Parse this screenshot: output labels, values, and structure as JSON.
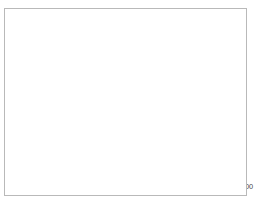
{
  "chart_data": {
    "type": "line",
    "title": "",
    "xlabel": "",
    "ylabel": "",
    "xlim": [
      1978,
      2000
    ],
    "ylim": [
      0,
      2500
    ],
    "grid": true,
    "legend_position": "top-left",
    "x": [
      1978,
      1979,
      1980,
      1981,
      1982,
      1983,
      1984,
      1985,
      1986,
      1987,
      1988,
      1989,
      1990,
      1991,
      1992,
      1993,
      1994,
      1995,
      1996,
      1997,
      1998,
      1999,
      2000
    ],
    "xtick_labels": [
      "1978",
      "1980",
      "1982",
      "1984",
      "1986",
      "1988",
      "1990",
      "1992",
      "1994",
      "1996",
      "1998",
      "2000"
    ],
    "xticks": [
      1978,
      1980,
      1982,
      1984,
      1986,
      1988,
      1990,
      1992,
      1994,
      1996,
      1998,
      2000
    ],
    "ytick_labels": [
      "0",
      "500",
      "1000",
      "1500",
      "2000",
      "2500"
    ],
    "yticks": [
      0,
      500,
      1000,
      1500,
      2000,
      2500
    ],
    "series": [
      {
        "name": "Krebsfälle insgesamt",
        "color": "#1a1a1a",
        "width": 2.1,
        "values": [
          95,
          110,
          105,
          175,
          140,
          165,
          215,
          260,
          310,
          370,
          460,
          620,
          650,
          720,
          1010,
          1390,
          1800,
          1945,
          1955,
          1780,
          1855,
          1830,
          1770
        ]
      },
      {
        "name": "BK 2402",
        "color": "#bdbdbd",
        "width": 1.8,
        "values": [
          20,
          60,
          95,
          125,
          150,
          175,
          215,
          250,
          280,
          300,
          320,
          325,
          330,
          340,
          395,
          460,
          520,
          570,
          600,
          615,
          630,
          655,
          680
        ]
      },
      {
        "name": "BK 4104",
        "color": "#6e6e6e",
        "width": 1.8,
        "values": [
          10,
          12,
          15,
          18,
          22,
          35,
          55,
          80,
          110,
          155,
          200,
          210,
          215,
          250,
          390,
          540,
          690,
          780,
          795,
          760,
          755,
          775,
          705
        ]
      },
      {
        "name": "BK 4105",
        "color": "#9d9d9d",
        "width": 0.9,
        "values": [
          0,
          0,
          0,
          0,
          0,
          0,
          0,
          0,
          0,
          0,
          0,
          0,
          0,
          5,
          175,
          330,
          480,
          430,
          400,
          310,
          330,
          260,
          215
        ]
      }
    ]
  },
  "legend": {
    "entries": [
      {
        "label": "Krebsfälle insgesamt"
      },
      {
        "label": "BK 2402"
      },
      {
        "label": "BK 4104"
      },
      {
        "label": "BK 4105"
      }
    ]
  }
}
